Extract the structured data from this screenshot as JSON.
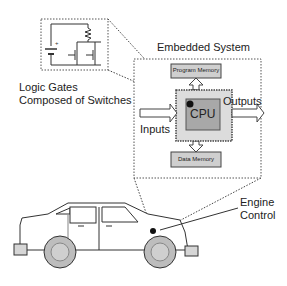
{
  "diagram": {
    "logic_gates": {
      "label_line1": "Logic Gates",
      "label_line2": "Composed of Switches"
    },
    "embedded_system": {
      "title": "Embedded System",
      "cpu": "CPU",
      "program_memory": "Program Memory",
      "data_memory": "Data Memory",
      "inputs": "Inputs",
      "outputs": "Outputs"
    },
    "car": {
      "label_line1": "Engine",
      "label_line2": "Control"
    }
  },
  "colors": {
    "line": "#333333",
    "cpu_outer_fill": "#dcdcdc",
    "cpu_inner_fill": "#a8a8a8",
    "memory_fill": "#cfcfcf",
    "wheel_fill": "#bdbdbd",
    "car_fill": "#ffffff"
  }
}
